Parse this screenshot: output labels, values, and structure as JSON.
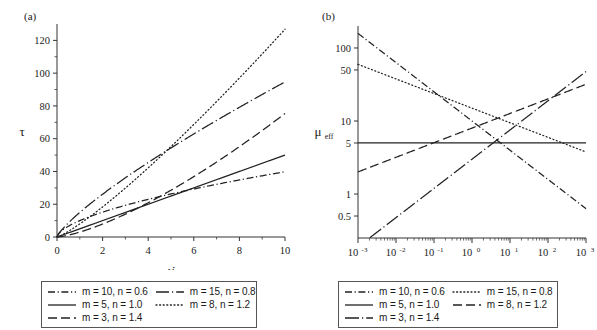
{
  "figure": {
    "panels": [
      {
        "tag": "(a)",
        "ylabel": "τ",
        "xlabel": "γ̇",
        "xticks": [
          "0",
          "2",
          "4",
          "6",
          "8",
          "10"
        ],
        "yticks": [
          "0",
          "20",
          "40",
          "60",
          "80",
          "100",
          "120"
        ]
      },
      {
        "tag": "(b)",
        "ylabel_base": "μ",
        "ylabel_sub": "eff",
        "xlabel": "γ̇",
        "xticks": [
          "10",
          "10",
          "10",
          "10",
          "10",
          "10",
          "10"
        ],
        "xtick_exponents": [
          "-3",
          "-2",
          "-1",
          "0",
          "1",
          "2",
          "3"
        ],
        "yticks": [
          "0.5",
          "1",
          "5",
          "10",
          "50",
          "100"
        ]
      }
    ],
    "legend": {
      "entries": [
        {
          "label": "m = 10, n = 0.6",
          "style_a": "dash-dot",
          "style_b": "dash-dot"
        },
        {
          "label": "m = 15, n = 0.8",
          "style_a": "long-dash-dot",
          "style_b": "dotted"
        },
        {
          "label": "m = 5, n = 1.0",
          "style_a": "solid",
          "style_b": "solid"
        },
        {
          "label": "m = 8, n = 1.2",
          "style_a": "dotted",
          "style_b": "long-dash"
        },
        {
          "label": "m = 3, n = 1.4",
          "style_a": "long-dash",
          "style_b": "solid-dot"
        }
      ]
    }
  },
  "chart_data": {
    "type": "line",
    "panels": [
      {
        "id": "a",
        "title": "(a)",
        "xlabel": "γ̇",
        "ylabel": "τ",
        "xscale": "linear",
        "yscale": "linear",
        "xlim": [
          0,
          10
        ],
        "ylim": [
          0,
          130
        ],
        "xticks": [
          0,
          2,
          4,
          6,
          8,
          10
        ],
        "yticks": [
          0,
          20,
          40,
          60,
          80,
          100,
          120
        ],
        "grid": false,
        "equation": "tau = m * gammadot^n",
        "series": [
          {
            "name": "m = 10, n = 0.6",
            "m": 10,
            "n": 0.6,
            "style": "dash-dot",
            "x": [
              0,
              1,
              2,
              4,
              6,
              8,
              10
            ],
            "y": [
              0,
              10.0,
              15.2,
              23.0,
              29.4,
              34.9,
              39.8
            ]
          },
          {
            "name": "m = 15, n = 0.8",
            "m": 15,
            "n": 0.8,
            "style": "long-dash-dot",
            "x": [
              0,
              1,
              2,
              4,
              6,
              8,
              10
            ],
            "y": [
              0,
              15.0,
              26.1,
              45.5,
              62.7,
              79.2,
              94.6
            ]
          },
          {
            "name": "m = 5, n = 1.0",
            "m": 5,
            "n": 1.0,
            "style": "solid",
            "x": [
              0,
              1,
              2,
              4,
              6,
              8,
              10
            ],
            "y": [
              0,
              5.0,
              10.0,
              20.0,
              30.0,
              40.0,
              50.0
            ]
          },
          {
            "name": "m = 8, n = 1.2",
            "m": 8,
            "n": 1.2,
            "style": "dotted",
            "x": [
              0,
              1,
              2,
              4,
              6,
              8,
              10
            ],
            "y": [
              0,
              8.0,
              18.4,
              42.2,
              69.0,
              97.1,
              126.7
            ]
          },
          {
            "name": "m = 3, n = 1.4",
            "m": 3,
            "n": 1.4,
            "style": "long-dash",
            "x": [
              0,
              1,
              2,
              4,
              6,
              8,
              10
            ],
            "y": [
              0,
              3.0,
              7.9,
              20.9,
              36.8,
              55.1,
              75.3
            ]
          }
        ]
      },
      {
        "id": "b",
        "title": "(b)",
        "xlabel": "γ̇",
        "ylabel": "μ_eff",
        "xscale": "log",
        "yscale": "log",
        "xlim": [
          0.001,
          1000
        ],
        "ylim": [
          0.25,
          200
        ],
        "xticks": [
          0.001,
          0.01,
          0.1,
          1,
          10,
          100,
          1000
        ],
        "yticks": [
          0.5,
          1,
          5,
          10,
          50,
          100
        ],
        "grid": false,
        "equation": "mu_eff = m * gammadot^(n-1)",
        "series": [
          {
            "name": "m = 10, n = 0.6",
            "m": 10,
            "n": 0.6,
            "style": "dash-dot",
            "x": [
              0.001,
              0.1,
              1,
              10,
              100,
              1000
            ],
            "y": [
              158.5,
              2.512,
              10.0,
              2.512,
              0.631,
              0.158
            ]
          },
          {
            "name": "m = 15, n = 0.8",
            "m": 15,
            "n": 0.8,
            "style": "dotted",
            "x": [
              0.001,
              0.1,
              1,
              10,
              100,
              1000
            ],
            "y": [
              59.8,
              23.8,
              15.0,
              9.45,
              5.96,
              3.76
            ]
          },
          {
            "name": "m = 5, n = 1.0",
            "m": 5,
            "n": 1.0,
            "style": "solid",
            "x": [
              0.001,
              1,
              1000
            ],
            "y": [
              5.0,
              5.0,
              5.0
            ]
          },
          {
            "name": "m = 8, n = 1.2",
            "m": 8,
            "n": 1.2,
            "style": "long-dash",
            "x": [
              0.001,
              0.1,
              1,
              10,
              100,
              1000
            ],
            "y": [
              2.01,
              5.05,
              8.0,
              12.68,
              20.1,
              31.8
            ]
          },
          {
            "name": "m = 3, n = 1.4",
            "m": 3,
            "n": 1.4,
            "style": "solid-dot",
            "x": [
              0.001,
              0.1,
              1,
              10,
              100,
              1000
            ],
            "y": [
              0.0189,
              0.476,
              3.0,
              18.9,
              119.4,
              752.0
            ]
          }
        ]
      }
    ]
  }
}
